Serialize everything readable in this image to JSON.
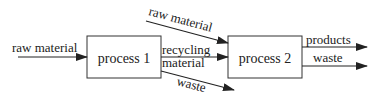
{
  "diagram": {
    "nodes": [
      {
        "id": "p1",
        "label": "process 1"
      },
      {
        "id": "p2",
        "label": "process 2"
      }
    ],
    "edges": {
      "raw_in_p1": "raw material",
      "raw_in_p2": "raw material",
      "recycling_line1": "recycling",
      "recycling_line2": "material",
      "waste_p1": "waste",
      "products_p2": "products",
      "waste_p2": "waste"
    },
    "colors": {
      "line": "#222222",
      "fill": "#ffffff"
    }
  }
}
